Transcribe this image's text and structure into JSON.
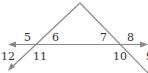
{
  "diagram": {
    "line_color": "#8a8a8a",
    "text_color": "#333333",
    "angle_labels": [
      {
        "id": "5",
        "text": "5",
        "x": 24,
        "y": 41
      },
      {
        "id": "6",
        "text": "6",
        "x": 52,
        "y": 41
      },
      {
        "id": "7",
        "text": "7",
        "x": 100,
        "y": 41
      },
      {
        "id": "8",
        "text": "8",
        "x": 127,
        "y": 41
      },
      {
        "id": "12",
        "text": "12",
        "x": 3,
        "y": 59
      },
      {
        "id": "11",
        "text": "11",
        "x": 34,
        "y": 59
      },
      {
        "id": "10",
        "text": "10",
        "x": 113,
        "y": 59
      },
      {
        "id": "9",
        "text": "9",
        "x": 146,
        "y": 59
      }
    ]
  }
}
